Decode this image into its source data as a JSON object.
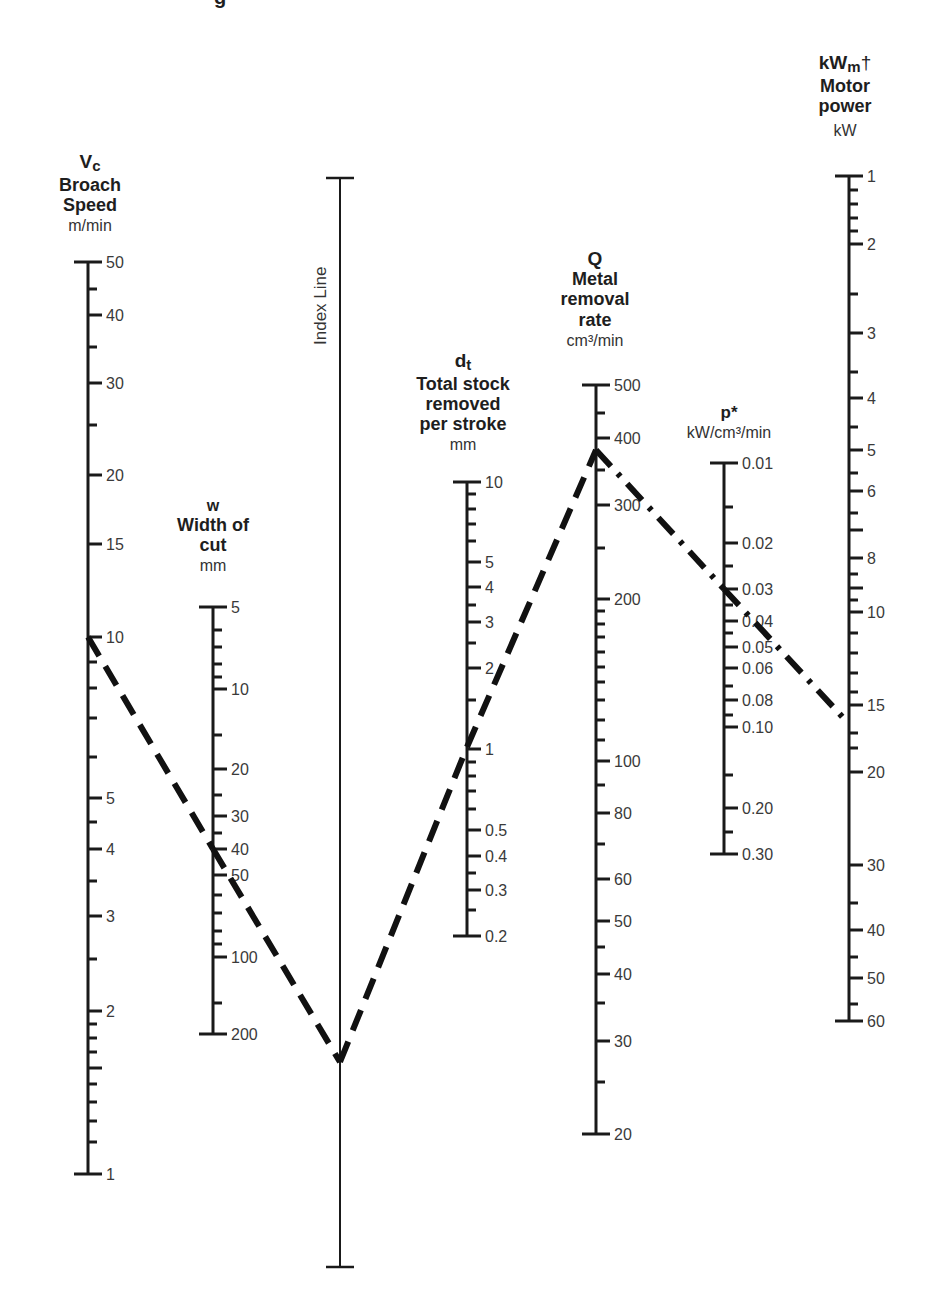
{
  "title_fragment": "g",
  "axes": {
    "vc": {
      "symbol": "V",
      "subscript": "c",
      "name_lines": [
        "Broach",
        "Speed"
      ],
      "unit": "m/min",
      "x": 88,
      "ticks": [
        {
          "y": 262,
          "label": "50",
          "len": "end"
        },
        {
          "y": 289,
          "len": "minor"
        },
        {
          "y": 315,
          "label": "40",
          "len": "major"
        },
        {
          "y": 347,
          "len": "minor"
        },
        {
          "y": 383,
          "label": "30",
          "len": "major"
        },
        {
          "y": 425,
          "len": "minor"
        },
        {
          "y": 475,
          "label": "20",
          "len": "major"
        },
        {
          "y": 544,
          "label": "15",
          "len": "major"
        },
        {
          "y": 637,
          "label": "10",
          "len": "major"
        },
        {
          "y": 662,
          "len": "minor"
        },
        {
          "y": 688,
          "len": "minor"
        },
        {
          "y": 718,
          "len": "minor"
        },
        {
          "y": 757,
          "len": "minor"
        },
        {
          "y": 798,
          "label": "5",
          "len": "major"
        },
        {
          "y": 822,
          "len": "minor"
        },
        {
          "y": 849,
          "label": "4",
          "len": "major"
        },
        {
          "y": 881,
          "len": "minor"
        },
        {
          "y": 916,
          "label": "3",
          "len": "major"
        },
        {
          "y": 959,
          "len": "minor"
        },
        {
          "y": 1011,
          "label": "2",
          "len": "major"
        },
        {
          "y": 1024,
          "len": "minor"
        },
        {
          "y": 1038,
          "len": "minor"
        },
        {
          "y": 1052,
          "len": "minor"
        },
        {
          "y": 1068,
          "len": "major"
        },
        {
          "y": 1084,
          "len": "minor"
        },
        {
          "y": 1102,
          "len": "minor"
        },
        {
          "y": 1121,
          "len": "minor"
        },
        {
          "y": 1142,
          "len": "minor"
        },
        {
          "y": 1174,
          "label": "1",
          "len": "end"
        }
      ]
    },
    "w": {
      "symbol": "w",
      "subscript": "",
      "name_lines": [
        "Width of",
        "cut"
      ],
      "unit": "mm",
      "x": 213,
      "ticks": [
        {
          "y": 607,
          "label": "5",
          "len": "end"
        },
        {
          "y": 630,
          "len": "minor"
        },
        {
          "y": 647,
          "len": "minor"
        },
        {
          "y": 664,
          "len": "minor"
        },
        {
          "y": 677,
          "len": "minor"
        },
        {
          "y": 689,
          "label": "10",
          "len": "major"
        },
        {
          "y": 735,
          "len": "minor"
        },
        {
          "y": 769,
          "label": "20",
          "len": "major"
        },
        {
          "y": 795,
          "len": "minor"
        },
        {
          "y": 816,
          "label": "30",
          "len": "major"
        },
        {
          "y": 833,
          "len": "minor"
        },
        {
          "y": 849,
          "label": "40",
          "len": "major"
        },
        {
          "y": 875,
          "label": "50",
          "len": "major"
        },
        {
          "y": 895,
          "len": "minor"
        },
        {
          "y": 913,
          "len": "minor"
        },
        {
          "y": 931,
          "len": "minor"
        },
        {
          "y": 944,
          "len": "minor"
        },
        {
          "y": 957,
          "label": "100",
          "len": "major"
        },
        {
          "y": 1003,
          "len": "minor"
        },
        {
          "y": 1034,
          "label": "200",
          "len": "end"
        }
      ]
    },
    "index": {
      "label": "Index Line",
      "x": 340,
      "top": 178,
      "bottom": 1267
    },
    "dt": {
      "symbol": "d",
      "subscript": "t",
      "name_lines": [
        "Total stock",
        "removed",
        "per stroke"
      ],
      "unit": "mm",
      "x": 467,
      "ticks": [
        {
          "y": 482,
          "label": "10",
          "len": "end"
        },
        {
          "y": 494,
          "len": "minor"
        },
        {
          "y": 509,
          "len": "minor"
        },
        {
          "y": 524,
          "len": "minor"
        },
        {
          "y": 541,
          "len": "minor"
        },
        {
          "y": 562,
          "label": "5",
          "len": "major"
        },
        {
          "y": 587,
          "label": "4",
          "len": "major"
        },
        {
          "y": 605,
          "len": "minor"
        },
        {
          "y": 622,
          "label": "3",
          "len": "major"
        },
        {
          "y": 643,
          "len": "minor"
        },
        {
          "y": 668,
          "label": "2",
          "len": "major"
        },
        {
          "y": 700,
          "len": "minor"
        },
        {
          "y": 749,
          "label": "1",
          "len": "major"
        },
        {
          "y": 762,
          "len": "minor"
        },
        {
          "y": 776,
          "len": "minor"
        },
        {
          "y": 791,
          "len": "minor"
        },
        {
          "y": 809,
          "len": "minor"
        },
        {
          "y": 830,
          "label": "0.5",
          "len": "major"
        },
        {
          "y": 856,
          "label": "0.4",
          "len": "major"
        },
        {
          "y": 873,
          "len": "minor"
        },
        {
          "y": 890,
          "label": "0.3",
          "len": "major"
        },
        {
          "y": 910,
          "len": "minor"
        },
        {
          "y": 936,
          "label": "0.2",
          "len": "end"
        }
      ]
    },
    "q": {
      "symbol": "Q",
      "subscript": "",
      "name_lines": [
        "Metal",
        "removal",
        "rate"
      ],
      "unit": "cm³/min",
      "x": 596,
      "ticks": [
        {
          "y": 385,
          "label": "500",
          "len": "end"
        },
        {
          "y": 413,
          "len": "minor"
        },
        {
          "y": 438,
          "label": "400",
          "len": "major"
        },
        {
          "y": 470,
          "len": "minor"
        },
        {
          "y": 505,
          "label": "300",
          "len": "major"
        },
        {
          "y": 548,
          "len": "minor"
        },
        {
          "y": 599,
          "label": "200",
          "len": "major"
        },
        {
          "y": 611,
          "len": "minor"
        },
        {
          "y": 624,
          "len": "minor"
        },
        {
          "y": 637,
          "len": "minor"
        },
        {
          "y": 652,
          "len": "minor"
        },
        {
          "y": 667,
          "len": "minor"
        },
        {
          "y": 682,
          "len": "minor"
        },
        {
          "y": 700,
          "len": "minor"
        },
        {
          "y": 720,
          "len": "minor"
        },
        {
          "y": 740,
          "len": "minor"
        },
        {
          "y": 761,
          "label": "100",
          "len": "major"
        },
        {
          "y": 785,
          "len": "minor"
        },
        {
          "y": 813,
          "label": "80",
          "len": "major"
        },
        {
          "y": 844,
          "len": "minor"
        },
        {
          "y": 879,
          "label": "60",
          "len": "major"
        },
        {
          "y": 921,
          "label": "50",
          "len": "major"
        },
        {
          "y": 947,
          "len": "minor"
        },
        {
          "y": 974,
          "label": "40",
          "len": "major"
        },
        {
          "y": 1003,
          "len": "minor"
        },
        {
          "y": 1041,
          "label": "30",
          "len": "major"
        },
        {
          "y": 1082,
          "len": "minor"
        },
        {
          "y": 1134,
          "label": "20",
          "len": "end"
        }
      ]
    },
    "p": {
      "symbol": "p*",
      "subscript": "",
      "name_lines": [],
      "unit": "kW/cm³/min",
      "x": 724,
      "ticks": [
        {
          "y": 463,
          "label": "0.01",
          "len": "end"
        },
        {
          "y": 507,
          "len": "minor"
        },
        {
          "y": 543,
          "label": "0.02",
          "len": "major"
        },
        {
          "y": 566,
          "len": "minor"
        },
        {
          "y": 589,
          "label": "0.03",
          "len": "major"
        },
        {
          "y": 605,
          "len": "minor"
        },
        {
          "y": 621,
          "label": "0.04",
          "len": "major"
        },
        {
          "y": 633,
          "len": "minor"
        },
        {
          "y": 647,
          "label": "0.05",
          "len": "major"
        },
        {
          "y": 668,
          "label": "0.06",
          "len": "major"
        },
        {
          "y": 686,
          "len": "minor"
        },
        {
          "y": 700,
          "label": "0.08",
          "len": "major"
        },
        {
          "y": 715,
          "len": "minor"
        },
        {
          "y": 727,
          "label": "0.10",
          "len": "major"
        },
        {
          "y": 775,
          "len": "minor"
        },
        {
          "y": 808,
          "label": "0.20",
          "len": "major"
        },
        {
          "y": 832,
          "len": "minor"
        },
        {
          "y": 854,
          "label": "0.30",
          "len": "end"
        }
      ]
    },
    "kw": {
      "symbol": "kW",
      "subscript": "m",
      "dagger": "†",
      "name_lines": [
        "Motor",
        "power"
      ],
      "unit": "kW",
      "x": 849,
      "ticks": [
        {
          "y": 176,
          "label": "1",
          "len": "end"
        },
        {
          "y": 190,
          "len": "minor"
        },
        {
          "y": 204,
          "len": "minor"
        },
        {
          "y": 218,
          "len": "minor"
        },
        {
          "y": 231,
          "len": "minor"
        },
        {
          "y": 244,
          "label": "2",
          "len": "major"
        },
        {
          "y": 294,
          "len": "minor"
        },
        {
          "y": 333,
          "label": "3",
          "len": "major"
        },
        {
          "y": 372,
          "len": "minor"
        },
        {
          "y": 398,
          "label": "4",
          "len": "major"
        },
        {
          "y": 427,
          "len": "minor"
        },
        {
          "y": 450,
          "label": "5",
          "len": "major"
        },
        {
          "y": 473,
          "len": "minor"
        },
        {
          "y": 491,
          "label": "6",
          "len": "major"
        },
        {
          "y": 513,
          "len": "minor"
        },
        {
          "y": 530,
          "len": "major"
        },
        {
          "y": 558,
          "label": "8",
          "len": "major"
        },
        {
          "y": 574,
          "len": "minor"
        },
        {
          "y": 588,
          "len": "major"
        },
        {
          "y": 600,
          "len": "minor"
        },
        {
          "y": 612,
          "label": "10",
          "len": "major"
        },
        {
          "y": 633,
          "len": "minor"
        },
        {
          "y": 653,
          "len": "minor"
        },
        {
          "y": 673,
          "len": "minor"
        },
        {
          "y": 692,
          "len": "minor"
        },
        {
          "y": 705,
          "label": "15",
          "len": "major"
        },
        {
          "y": 733,
          "len": "minor"
        },
        {
          "y": 748,
          "len": "minor"
        },
        {
          "y": 772,
          "label": "20",
          "len": "major"
        },
        {
          "y": 865,
          "label": "30",
          "len": "major"
        },
        {
          "y": 903,
          "len": "minor"
        },
        {
          "y": 930,
          "label": "40",
          "len": "major"
        },
        {
          "y": 957,
          "len": "minor"
        },
        {
          "y": 978,
          "label": "50",
          "len": "major"
        },
        {
          "y": 1004,
          "len": "minor"
        },
        {
          "y": 1021,
          "label": "60",
          "len": "end"
        }
      ]
    }
  },
  "example_path": {
    "description": "Dashed example line through nomogram",
    "points": [
      {
        "axis": "vc",
        "value": "10",
        "x": 88,
        "y": 637
      },
      {
        "axis": "w",
        "value": "40",
        "x": 213,
        "y": 849
      },
      {
        "axis": "index",
        "value": "pivot",
        "x": 340,
        "y": 1062
      },
      {
        "axis": "dt",
        "value": "1",
        "x": 467,
        "y": 747
      },
      {
        "axis": "q",
        "value": "370",
        "x": 596,
        "y": 450
      },
      {
        "axis": "p",
        "value": "0.03",
        "x": 724,
        "y": 589
      },
      {
        "axis": "kw",
        "value": "16",
        "x": 849,
        "y": 724
      }
    ]
  },
  "chart_data": {
    "type": "nomogram",
    "title": "",
    "scales": [
      {
        "name": "Vc Broach Speed",
        "unit": "m/min",
        "range": [
          1,
          50
        ],
        "labels": [
          "50",
          "40",
          "30",
          "20",
          "15",
          "10",
          "5",
          "4",
          "3",
          "2",
          "1"
        ]
      },
      {
        "name": "w Width of cut",
        "unit": "mm",
        "range": [
          5,
          200
        ],
        "labels": [
          "5",
          "10",
          "20",
          "30",
          "40",
          "50",
          "100",
          "200"
        ]
      },
      {
        "name": "Index Line",
        "unit": "",
        "range": null,
        "labels": []
      },
      {
        "name": "dt Total stock removed per stroke",
        "unit": "mm",
        "range": [
          0.2,
          10
        ],
        "labels": [
          "10",
          "5",
          "4",
          "3",
          "2",
          "1",
          "0.5",
          "0.4",
          "0.3",
          "0.2"
        ]
      },
      {
        "name": "Q Metal removal rate",
        "unit": "cm³/min",
        "range": [
          20,
          500
        ],
        "labels": [
          "500",
          "400",
          "300",
          "200",
          "100",
          "80",
          "60",
          "50",
          "40",
          "30",
          "20"
        ]
      },
      {
        "name": "p* ",
        "unit": "kW/cm³/min",
        "range": [
          0.01,
          0.3
        ],
        "labels": [
          "0.01",
          "0.02",
          "0.03",
          "0.04",
          "0.05",
          "0.06",
          "0.08",
          "0.10",
          "0.20",
          "0.30"
        ]
      },
      {
        "name": "kWm† Motor power",
        "unit": "kW",
        "range": [
          1,
          60
        ],
        "labels": [
          "1",
          "2",
          "3",
          "4",
          "5",
          "6",
          "8",
          "10",
          "15",
          "20",
          "30",
          "40",
          "50",
          "60"
        ]
      }
    ],
    "example": {
      "Vc": 10,
      "w": 40,
      "dt": 1,
      "Q": 370,
      "p": 0.03,
      "kWm": 16
    }
  }
}
